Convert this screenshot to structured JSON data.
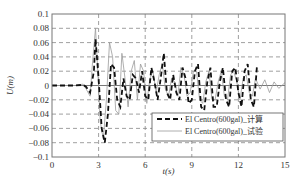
{
  "chart_data": {
    "type": "line",
    "title": "",
    "xlabel": "t(s)",
    "ylabel": "U(m)",
    "xlim": [
      0,
      15
    ],
    "ylim": [
      -0.1,
      0.1
    ],
    "x_ticks": [
      0,
      3,
      6,
      9,
      12,
      15
    ],
    "x_tick_labels": [
      "0",
      "3",
      "6",
      "9",
      "12",
      "15"
    ],
    "y_ticks": [
      0.1,
      0.08,
      0.06,
      0.04,
      0.02,
      0,
      -0.02,
      -0.04,
      -0.06,
      -0.08,
      -0.1
    ],
    "y_tick_labels": [
      "0.1",
      "0.08",
      "0.06",
      "0.04",
      "0.02",
      "0",
      "−0.02",
      "−0.04",
      "−0.06",
      "−0.08",
      "−0.1"
    ],
    "grid": true,
    "legend_position": "lower right",
    "series": [
      {
        "name": "El Centro(600gal)_计算",
        "style": "dashed",
        "color": "#111111",
        "x": [
          0,
          1.5,
          2.0,
          2.2,
          2.45,
          2.7,
          2.8,
          3.0,
          3.2,
          3.4,
          3.6,
          3.8,
          4.0,
          4.2,
          4.4,
          4.6,
          4.8,
          5.0,
          5.2,
          5.4,
          5.6,
          5.8,
          6.0,
          6.2,
          6.4,
          6.6,
          6.8,
          7.0,
          7.2,
          7.4,
          7.6,
          7.8,
          8.0,
          8.2,
          8.4,
          8.6,
          8.8,
          9.0,
          9.2,
          9.4,
          9.6,
          9.8,
          10.0,
          10.2,
          10.4,
          10.6,
          10.8,
          11.0,
          11.2,
          11.4,
          11.6,
          11.8,
          12.0,
          12.2,
          12.4,
          12.6,
          12.8,
          13.0,
          13.2
        ],
        "y": [
          0,
          0,
          0.001,
          -0.002,
          -0.01,
          0.02,
          0.065,
          0.01,
          -0.06,
          -0.08,
          -0.04,
          0.03,
          0.025,
          -0.02,
          -0.03,
          0.01,
          -0.015,
          -0.02,
          0.015,
          0.01,
          -0.01,
          0.02,
          -0.015,
          -0.02,
          0.025,
          0.005,
          -0.02,
          0.01,
          0.045,
          -0.01,
          -0.02,
          0.015,
          -0.01,
          -0.02,
          0.025,
          0.01,
          -0.025,
          -0.02,
          0.02,
          0.03,
          -0.03,
          -0.035,
          0.005,
          0.025,
          -0.03,
          -0.03,
          0.005,
          0.025,
          -0.02,
          -0.03,
          0.02,
          0.025,
          -0.01,
          -0.03,
          0.02,
          0.03,
          -0.02,
          -0.03,
          0.028
        ]
      },
      {
        "name": "El Centro(600gal)_试验",
        "style": "solid",
        "color": "#9a9a9a",
        "x": [
          0,
          1.5,
          2.0,
          2.2,
          2.45,
          2.6,
          2.8,
          2.95,
          3.1,
          3.3,
          3.5,
          3.7,
          3.9,
          4.1,
          4.3,
          4.5,
          4.7,
          4.9,
          5.1,
          5.3,
          5.5,
          5.7,
          5.9,
          6.1,
          6.3,
          6.5,
          6.7,
          6.9,
          7.1,
          7.3,
          7.5,
          7.7,
          7.9,
          8.1,
          8.3,
          8.5,
          8.7,
          8.9,
          9.1,
          9.3,
          9.5,
          9.7,
          9.9,
          10.1,
          10.3,
          10.5,
          10.7,
          10.9,
          11.1,
          11.3,
          11.5,
          11.7,
          11.9,
          12.1,
          12.3,
          12.5,
          12.7,
          12.9,
          13.1,
          13.4,
          13.7,
          14.0,
          14.3,
          14.6,
          15.0
        ],
        "y": [
          0,
          0,
          0.002,
          -0.005,
          -0.015,
          0.03,
          0.08,
          0.02,
          -0.05,
          -0.075,
          -0.02,
          0.06,
          0.04,
          -0.035,
          -0.04,
          0.045,
          0.01,
          -0.03,
          0.02,
          0.035,
          -0.02,
          0.03,
          0.02,
          -0.025,
          0.01,
          0.02,
          -0.01,
          0.015,
          0.03,
          -0.005,
          -0.015,
          0.01,
          0.005,
          -0.015,
          0.025,
          0.015,
          -0.015,
          -0.01,
          0.02,
          0.02,
          -0.02,
          -0.025,
          0.005,
          0.02,
          -0.02,
          -0.02,
          0.005,
          0.02,
          -0.015,
          -0.02,
          0.015,
          0.02,
          0.005,
          -0.02,
          0.01,
          0.015,
          -0.01,
          -0.015,
          0.01,
          -0.005,
          0.008,
          -0.01,
          0.005,
          -0.004,
          0.004
        ]
      }
    ]
  },
  "legend": {
    "entries": [
      {
        "label": "El Centro(600gal)_计算",
        "style": "dashed"
      },
      {
        "label": "El Centro(600gal)_试验",
        "style": "solid"
      }
    ]
  }
}
